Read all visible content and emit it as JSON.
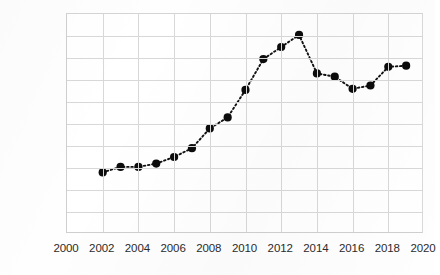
{
  "chart_data": {
    "type": "line",
    "title": "",
    "subtitle": "",
    "xlabel": "",
    "ylabel": "",
    "xlim": [
      2000,
      2020
    ],
    "ylim": [
      0,
      200000
    ],
    "grid": true,
    "legend": "none",
    "marker": "filled-circle",
    "line_style": "dotted",
    "x_tick_labels": [
      "2000",
      "2002",
      "2004",
      "2006",
      "2008",
      "2010",
      "2012",
      "2014",
      "2016",
      "2018",
      "2020"
    ],
    "x_ticks": [
      2000,
      2002,
      2004,
      2006,
      2008,
      2010,
      2012,
      2014,
      2016,
      2018,
      2020
    ],
    "y_tick_labels": [
      "200,000",
      "180,000",
      "160,000",
      "140,000",
      "120,000",
      "100,000",
      "80,000",
      "60,000",
      "40,000",
      "20,000",
      "-"
    ],
    "y_ticks": [
      200000,
      180000,
      160000,
      140000,
      120000,
      100000,
      80000,
      60000,
      40000,
      20000,
      0
    ],
    "x": [
      2002,
      2003,
      2004,
      2005,
      2006,
      2007,
      2008,
      2009,
      2010,
      2011,
      2012,
      2013,
      2014,
      2015,
      2016,
      2017,
      2018
    ],
    "values": [
      56000,
      61000,
      61000,
      64000,
      70000,
      78000,
      96000,
      106000,
      131000,
      159000,
      170000,
      181000,
      146000,
      143000,
      132000,
      135000,
      152000
    ],
    "series": [
      {
        "name": "series-1",
        "color": "#111111",
        "points": [
          {
            "x": 2002,
            "y": 56000
          },
          {
            "x": 2003,
            "y": 61000
          },
          {
            "x": 2004,
            "y": 61000
          },
          {
            "x": 2005,
            "y": 64000
          },
          {
            "x": 2006,
            "y": 70000
          },
          {
            "x": 2007,
            "y": 78000
          },
          {
            "x": 2008,
            "y": 96000
          },
          {
            "x": 2009,
            "y": 106000
          },
          {
            "x": 2010,
            "y": 131000
          },
          {
            "x": 2011,
            "y": 159000
          },
          {
            "x": 2012,
            "y": 170000
          },
          {
            "x": 2013,
            "y": 181000
          },
          {
            "x": 2014,
            "y": 146000
          },
          {
            "x": 2015,
            "y": 143000
          },
          {
            "x": 2016,
            "y": 132000
          },
          {
            "x": 2017,
            "y": 135000
          },
          {
            "x": 2018,
            "y": 152000
          },
          {
            "x": 2019,
            "y": 153000
          }
        ]
      }
    ],
    "colors": {
      "line": "#111111",
      "marker": "#0c0c0c",
      "grid": "#d8d8d8",
      "axis": "#cfcfcf",
      "text": "#2b2b2b",
      "background": "#ffffff"
    }
  }
}
